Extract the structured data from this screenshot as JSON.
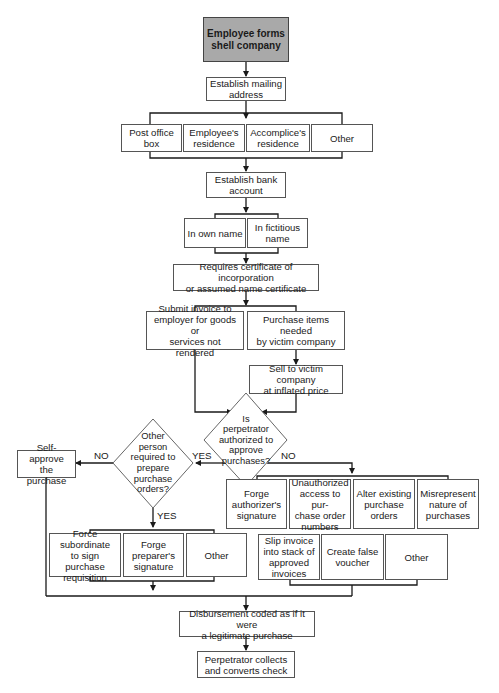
{
  "diagram": {
    "type": "flowchart",
    "start": {
      "label": "Employee forms\nshell company"
    },
    "steps": {
      "mailing": "Establish mailing\naddress",
      "address_options": [
        "Post office\nbox",
        "Employee's\nresidence",
        "Accomplice's\nresidence",
        "Other"
      ],
      "bank": "Establish bank\naccount",
      "name_options": [
        "In own name",
        "In fictitious\nname"
      ],
      "certificate": "Requires certificate of incorporation\nor assumed name certificate",
      "submit_invoice": "Submit invoice to\nemployer for goods or\nservices not rendered",
      "purchase_items": "Purchase items needed\nby victim company",
      "sell_inflated": "Sell to victim company\nat inflated price",
      "self_approve": "Self-approve\nthe purchase",
      "yes_options": [
        "Force subordinate\nto sign purchase\nrequisition",
        "Forge\npreparer's\nsignature",
        "Other"
      ],
      "no_options_row1": [
        "Forge\nauthorizer's\nsignature",
        "Unauthorized\naccess to pur-\nchase order\nnumbers",
        "Alter existing\npurchase\norders",
        "Misrepresent\nnature of\npurchases"
      ],
      "no_options_row2": [
        "Slip invoice\ninto stack of\napproved\ninvoices",
        "Create false\nvoucher",
        "Other"
      ],
      "disbursement": "Disbursement coded as if it were\na legitimate purchase",
      "collect": "Perpetrator collects\nand converts check"
    },
    "decisions": {
      "authorized": "Is\nperpetrator\nauthorized to\napprove\npurchases?",
      "other_person": "Other\nperson\nrequired to\nprepare\npurchase\norders?"
    },
    "edge_labels": {
      "auth_yes": "YES",
      "auth_no": "NO",
      "other_no": "NO",
      "other_yes": "YES"
    },
    "colors": {
      "start_fill": "#a9a9a9",
      "line": "#1a1a1a",
      "box_border": "#555555"
    }
  }
}
